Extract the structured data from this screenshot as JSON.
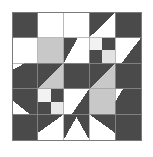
{
  "artwork": {
    "title": "Quilt Block Pattern",
    "kind": "geometric-quilt-block",
    "canvas": {
      "width": 153,
      "height": 157,
      "background": "#ffffff"
    },
    "block": {
      "x": 12,
      "y": 12,
      "width": 129,
      "height": 128,
      "grid": 5,
      "cell": 25.8
    },
    "palette": {
      "dark": "#4a4a4a",
      "light": "#c8c8c8",
      "white": "#ffffff",
      "grid_line": "#9a9a9a",
      "border": "#7a7a7a"
    },
    "legend": [
      {
        "name": "dark-gray-fabric",
        "color": "#4a4a4a"
      },
      {
        "name": "light-gray-fabric",
        "color": "#c8c8c8"
      },
      {
        "name": "white-fabric",
        "color": "#ffffff"
      }
    ],
    "cells": [
      {
        "name": "cell-r0c0-corner-dark",
        "row": 0,
        "col": 0,
        "shapes": [
          {
            "type": "square",
            "fill": "dark"
          }
        ]
      },
      {
        "name": "cell-r0c1-white",
        "row": 0,
        "col": 1,
        "shapes": [
          {
            "type": "square",
            "fill": "white"
          }
        ]
      },
      {
        "name": "cell-r0c2-white",
        "row": 0,
        "col": 2,
        "shapes": [
          {
            "type": "square",
            "fill": "white"
          }
        ]
      },
      {
        "name": "cell-r0c3-half-square-triangle",
        "row": 0,
        "col": 3,
        "shapes": [
          {
            "type": "square",
            "fill": "dark"
          },
          {
            "type": "triangle",
            "fill": "white",
            "corners": "br-bl-tr-none",
            "points": "1,1 0,1 1,0"
          }
        ]
      },
      {
        "name": "cell-r0c4-corner-dark",
        "row": 0,
        "col": 4,
        "shapes": [
          {
            "type": "square",
            "fill": "dark"
          }
        ]
      },
      {
        "name": "cell-r1c0-white",
        "row": 1,
        "col": 0,
        "shapes": [
          {
            "type": "square",
            "fill": "white"
          }
        ]
      },
      {
        "name": "cell-r1c1-light",
        "row": 1,
        "col": 1,
        "shapes": [
          {
            "type": "square",
            "fill": "light"
          }
        ]
      },
      {
        "name": "cell-r1c2-triangle-dark-left",
        "row": 1,
        "col": 2,
        "shapes": [
          {
            "type": "square",
            "fill": "white"
          },
          {
            "type": "triangle",
            "fill": "dark",
            "points": "0,0 0.55,0 0,1"
          }
        ]
      },
      {
        "name": "cell-r1c3-four-patch-top",
        "row": 1,
        "col": 3,
        "shapes": [
          {
            "type": "quarter",
            "fill": "white",
            "q": "tl"
          },
          {
            "type": "quarter",
            "fill": "dark",
            "q": "tr"
          },
          {
            "type": "quarter",
            "fill": "dark",
            "q": "bl"
          },
          {
            "type": "quarter",
            "fill": "light",
            "q": "br"
          }
        ]
      },
      {
        "name": "cell-r1c4-triangle-dark-right",
        "row": 1,
        "col": 4,
        "shapes": [
          {
            "type": "square",
            "fill": "white"
          },
          {
            "type": "triangle",
            "fill": "dark",
            "points": "1,0 1,1 0.25,1"
          }
        ]
      },
      {
        "name": "cell-r2c0-triangle-dark",
        "row": 2,
        "col": 0,
        "shapes": [
          {
            "type": "square",
            "fill": "dark"
          },
          {
            "type": "triangle",
            "fill": "white",
            "points": "0,1 1,1 0,0.55"
          }
        ]
      },
      {
        "name": "cell-r2c1-triangle-dark-top",
        "row": 2,
        "col": 1,
        "shapes": [
          {
            "type": "square",
            "fill": "light"
          },
          {
            "type": "triangle",
            "fill": "dark",
            "points": "0,0 1,0 0,1"
          }
        ]
      },
      {
        "name": "cell-r2c2-center-dark",
        "row": 2,
        "col": 2,
        "shapes": [
          {
            "type": "square",
            "fill": "dark"
          }
        ]
      },
      {
        "name": "cell-r2c3-triangle-light",
        "row": 2,
        "col": 3,
        "shapes": [
          {
            "type": "square",
            "fill": "dark"
          },
          {
            "type": "triangle",
            "fill": "light",
            "points": "1,0 1,1 0,1"
          }
        ]
      },
      {
        "name": "cell-r2c4-dark",
        "row": 2,
        "col": 4,
        "shapes": [
          {
            "type": "square",
            "fill": "dark"
          }
        ]
      },
      {
        "name": "cell-r3c0-triangle-dark",
        "row": 3,
        "col": 0,
        "shapes": [
          {
            "type": "square",
            "fill": "dark"
          },
          {
            "type": "triangle",
            "fill": "white",
            "points": "0,1 0,0.45 0.7,1"
          }
        ]
      },
      {
        "name": "cell-r3c1-four-patch-bottom",
        "row": 3,
        "col": 1,
        "shapes": [
          {
            "type": "quarter",
            "fill": "white",
            "q": "tl"
          },
          {
            "type": "quarter",
            "fill": "dark",
            "q": "tr"
          },
          {
            "type": "quarter",
            "fill": "dark",
            "q": "bl"
          },
          {
            "type": "quarter",
            "fill": "light",
            "q": "br"
          }
        ]
      },
      {
        "name": "cell-r3c2-triangle-dark-right",
        "row": 3,
        "col": 2,
        "shapes": [
          {
            "type": "square",
            "fill": "white"
          },
          {
            "type": "triangle",
            "fill": "dark",
            "points": "1,0 1,1 0.3,1"
          }
        ]
      },
      {
        "name": "cell-r3c3-light",
        "row": 3,
        "col": 3,
        "shapes": [
          {
            "type": "square",
            "fill": "light"
          }
        ]
      },
      {
        "name": "cell-r3c4-triangle-dark",
        "row": 3,
        "col": 4,
        "shapes": [
          {
            "type": "square",
            "fill": "dark"
          },
          {
            "type": "triangle",
            "fill": "white",
            "points": "1,0 1,1 0.2,0.1"
          }
        ]
      },
      {
        "name": "cell-r4c0-corner-dark",
        "row": 4,
        "col": 0,
        "shapes": [
          {
            "type": "square",
            "fill": "dark"
          }
        ]
      },
      {
        "name": "cell-r4c1-triangle-dark-top",
        "row": 4,
        "col": 1,
        "shapes": [
          {
            "type": "square",
            "fill": "white"
          },
          {
            "type": "triangle",
            "fill": "dark",
            "points": "0,0 1,0 0,0.85"
          }
        ]
      },
      {
        "name": "cell-r4c2-triangle-dark",
        "row": 4,
        "col": 2,
        "shapes": [
          {
            "type": "square",
            "fill": "dark"
          },
          {
            "type": "triangle",
            "fill": "white",
            "points": "0,1 0.5,0.1 1,1"
          }
        ]
      },
      {
        "name": "cell-r4c3-triangle-dark-top",
        "row": 4,
        "col": 3,
        "shapes": [
          {
            "type": "square",
            "fill": "white"
          },
          {
            "type": "triangle",
            "fill": "dark",
            "points": "1,0 0,0 1,0.85"
          }
        ]
      },
      {
        "name": "cell-r4c4-corner-dark",
        "row": 4,
        "col": 4,
        "shapes": [
          {
            "type": "square",
            "fill": "dark"
          }
        ]
      }
    ]
  }
}
